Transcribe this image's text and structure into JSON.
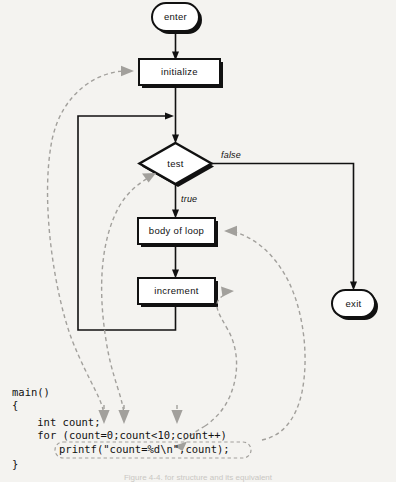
{
  "figure": {
    "background_color": "#f4f3f0",
    "flow_color": "#111111",
    "annotation_color": "#a2a09c",
    "caption": "Figure 4-4.  for structure and its equivalent"
  },
  "flowchart": {
    "nodes": [
      {
        "id": "enter",
        "label": "enter",
        "shape": "terminator"
      },
      {
        "id": "initialize",
        "label": "initialize",
        "shape": "process"
      },
      {
        "id": "test",
        "label": "test",
        "shape": "decision"
      },
      {
        "id": "body",
        "label": "body of loop",
        "shape": "process"
      },
      {
        "id": "increment",
        "label": "increment",
        "shape": "process"
      },
      {
        "id": "exit",
        "label": "exit",
        "shape": "terminator"
      }
    ],
    "branch_labels": {
      "false": "false",
      "true": "true"
    }
  },
  "code": {
    "language": "C",
    "lines": [
      "main()",
      "{",
      "    int count;",
      "    for (count=0;count<10;count++)",
      "        printf(\"count=%d\\n\",count);",
      "}"
    ],
    "line_main": "main()",
    "line_open_brace": "{",
    "line_declaration": "    int count;",
    "line_for": "    for (count=0;count<10;count++)",
    "line_printf": "printf(\"count=%d\\n\",count);",
    "line_close_brace": "}"
  },
  "annotations": [
    {
      "id": "ann-initialize",
      "from_node": "initialize",
      "to_code": "count=0",
      "style": "dashed-gray"
    },
    {
      "id": "ann-test",
      "from_node": "test",
      "to_code": "count<10",
      "style": "dashed-gray"
    },
    {
      "id": "ann-increment",
      "from_node": "increment",
      "to_code": "count++",
      "style": "dashed-gray"
    },
    {
      "id": "ann-body",
      "from_node": "body",
      "to_code": "printf statement",
      "style": "dashed-gray"
    }
  ]
}
